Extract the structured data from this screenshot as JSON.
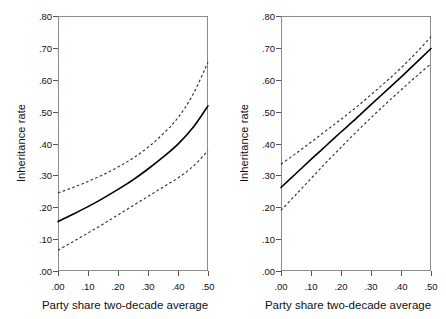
{
  "figure": {
    "background_color": "#ffffff",
    "frame_color": "#8c8c8c",
    "fit_line_color": "#000000",
    "ci_line_color": "#333333"
  },
  "axis": {
    "ylabel": "Inheritance rate",
    "xlabel": "Party share two-decade average",
    "yticks": [
      ".80",
      ".70",
      ".60",
      ".50",
      ".40",
      ".30",
      ".20",
      ".10",
      ".00"
    ],
    "ytick_values": [
      0.8,
      0.7,
      0.6,
      0.5,
      0.4,
      0.3,
      0.2,
      0.1,
      0.0
    ],
    "xticks": [
      ".00",
      ".10",
      ".20",
      ".30",
      ".40",
      ".50"
    ],
    "xtick_values": [
      0.0,
      0.1,
      0.2,
      0.3,
      0.4,
      0.5
    ],
    "ylim": [
      0.0,
      0.8
    ],
    "xlim": [
      0.0,
      0.5
    ]
  },
  "chart_data": [
    {
      "type": "line",
      "panel": "left",
      "title": "",
      "xlabel": "Party share two-decade average",
      "ylabel": "Inheritance rate",
      "xlim": [
        0.0,
        0.5
      ],
      "ylim": [
        0.0,
        0.8
      ],
      "grid": false,
      "legend": "none",
      "x": [
        0.0,
        0.05,
        0.1,
        0.15,
        0.2,
        0.25,
        0.3,
        0.35,
        0.4,
        0.45,
        0.5
      ],
      "series": [
        {
          "name": "Predicted inheritance rate",
          "style": "solid",
          "values": [
            0.155,
            0.178,
            0.202,
            0.228,
            0.256,
            0.286,
            0.32,
            0.357,
            0.398,
            0.45,
            0.518
          ]
        },
        {
          "name": "95% CI upper",
          "style": "dashed",
          "values": [
            0.245,
            0.262,
            0.281,
            0.302,
            0.326,
            0.354,
            0.388,
            0.43,
            0.481,
            0.554,
            0.655
          ]
        },
        {
          "name": "95% CI lower",
          "style": "dashed",
          "values": [
            0.065,
            0.092,
            0.119,
            0.147,
            0.176,
            0.205,
            0.234,
            0.263,
            0.292,
            0.328,
            0.377
          ]
        }
      ]
    },
    {
      "type": "line",
      "panel": "right",
      "title": "",
      "xlabel": "Party share two-decade average",
      "ylabel": "Inheritance rate",
      "xlim": [
        0.0,
        0.5
      ],
      "ylim": [
        0.0,
        0.8
      ],
      "grid": false,
      "legend": "none",
      "x": [
        0.0,
        0.05,
        0.1,
        0.15,
        0.2,
        0.25,
        0.3,
        0.35,
        0.4,
        0.45,
        0.5
      ],
      "series": [
        {
          "name": "Predicted inheritance rate",
          "style": "solid",
          "values": [
            0.262,
            0.306,
            0.35,
            0.393,
            0.436,
            0.478,
            0.522,
            0.565,
            0.608,
            0.653,
            0.698
          ]
        },
        {
          "name": "95% CI upper",
          "style": "dashed",
          "values": [
            0.335,
            0.369,
            0.404,
            0.44,
            0.476,
            0.513,
            0.553,
            0.594,
            0.637,
            0.684,
            0.735
          ]
        },
        {
          "name": "95% CI lower",
          "style": "dashed",
          "values": [
            0.19,
            0.24,
            0.29,
            0.34,
            0.388,
            0.435,
            0.481,
            0.525,
            0.568,
            0.61,
            0.65
          ]
        }
      ]
    }
  ]
}
